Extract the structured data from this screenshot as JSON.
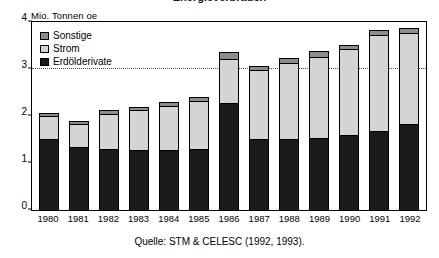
{
  "title_partial": "Energieverbrauch",
  "ylabel": "Mio. Tonnen oe",
  "source": "Quelle: STM & CELESC (1992, 1993).",
  "legend": {
    "items": [
      {
        "label": "Sonstige",
        "color": "#8c8c8c"
      },
      {
        "label": "Strom",
        "color": "#d4d4d4"
      },
      {
        "label": "Erdölderivate",
        "color": "#1a1a1a"
      }
    ]
  },
  "axis": {
    "yticks": [
      "0",
      "1",
      "2",
      "3",
      "4"
    ],
    "gridline_values": [
      3
    ]
  },
  "chart_data": {
    "type": "bar",
    "stacked": true,
    "title": "Energieverbrauch",
    "xlabel": "",
    "ylabel": "Mio. Tonnen oe",
    "ylim": [
      0,
      4
    ],
    "yticks": [
      0,
      1,
      2,
      3,
      4
    ],
    "grid": true,
    "gridlines": [
      3
    ],
    "legend_position": "top-left",
    "categories": [
      "1980",
      "1981",
      "1982",
      "1983",
      "1984",
      "1985",
      "1986",
      "1987",
      "1988",
      "1989",
      "1990",
      "1991",
      "1992"
    ],
    "series": [
      {
        "name": "Erdölderivate",
        "color": "#1a1a1a",
        "values": [
          1.5,
          1.32,
          1.27,
          1.25,
          1.25,
          1.27,
          2.25,
          1.5,
          1.5,
          1.52,
          1.57,
          1.65,
          1.8
        ]
      },
      {
        "name": "Strom",
        "color": "#d4d4d4",
        "values": [
          0.47,
          0.48,
          0.75,
          0.85,
          0.95,
          1.03,
          0.95,
          1.45,
          1.6,
          1.72,
          1.83,
          2.05,
          1.95
        ]
      },
      {
        "name": "Sonstige",
        "color": "#8c8c8c",
        "values": [
          0.08,
          0.07,
          0.08,
          0.08,
          0.08,
          0.08,
          0.15,
          0.1,
          0.12,
          0.13,
          0.1,
          0.1,
          0.1
        ]
      }
    ],
    "totals": [
      2.05,
      1.87,
      2.1,
      2.18,
      2.28,
      2.38,
      3.35,
      3.05,
      3.22,
      3.37,
      3.5,
      3.8,
      3.85
    ]
  }
}
